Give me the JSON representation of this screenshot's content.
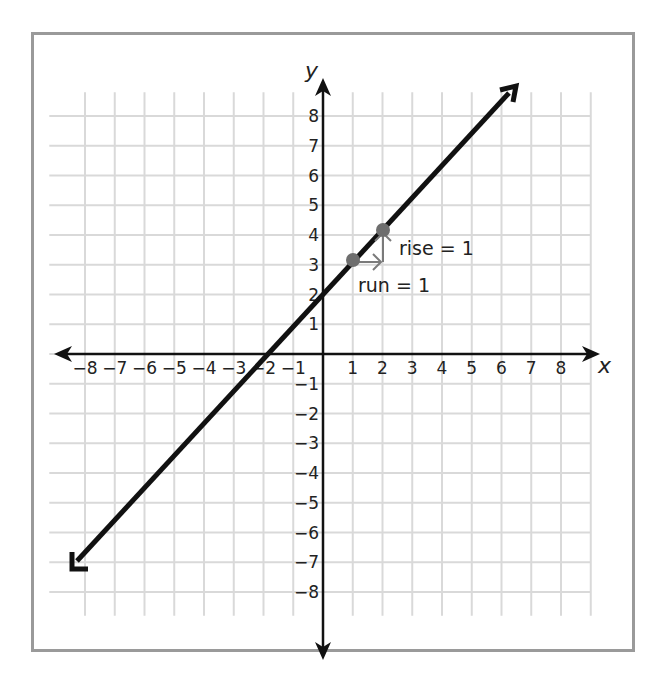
{
  "chart_data": {
    "type": "line",
    "title": "",
    "xlabel": "x",
    "ylabel": "y",
    "xlim": [
      -8,
      8
    ],
    "ylim": [
      -8,
      8
    ],
    "grid": true,
    "x_ticks": [
      "-8",
      "-7",
      "-6",
      "-5",
      "-4",
      "-3",
      "-2",
      "-1",
      "1",
      "2",
      "3",
      "4",
      "5",
      "6",
      "7",
      "8"
    ],
    "y_ticks": [
      "8",
      "7",
      "6",
      "5",
      "4",
      "3",
      "2",
      "1",
      "-1",
      "-2",
      "-3",
      "-4",
      "-5",
      "-6",
      "-7",
      "-8"
    ],
    "series": [
      {
        "name": "y = x + 2",
        "slope": 1,
        "y_intercept": 2,
        "x_intercept": -2,
        "endpoints": [
          {
            "x": -8.3,
            "y": -6.3
          },
          {
            "x": 6.6,
            "y": 8.6
          }
        ],
        "arrows": "both ends"
      }
    ],
    "points": [
      {
        "x": 1,
        "y": 3
      },
      {
        "x": 2,
        "y": 4
      }
    ],
    "annotations": [
      {
        "text": "rise = 1",
        "type": "vertical arrow",
        "from": {
          "x": 2,
          "y": 3
        },
        "to": {
          "x": 2,
          "y": 4
        }
      },
      {
        "text": "run = 1",
        "type": "horizontal arrow",
        "from": {
          "x": 1,
          "y": 3
        },
        "to": {
          "x": 2,
          "y": 3
        }
      }
    ]
  },
  "labels": {
    "x_axis": "x",
    "y_axis": "y",
    "rise": "rise = 1",
    "run": "run = 1"
  },
  "ticks": {
    "x_neg": [
      "−8",
      "−7",
      "−6",
      "−5",
      "−4",
      "−3",
      "−2",
      "−1"
    ],
    "x_pos": [
      "1",
      "2",
      "3",
      "4",
      "5",
      "6",
      "7",
      "8"
    ],
    "y_pos": [
      "1",
      "2",
      "3",
      "4",
      "5",
      "6",
      "7",
      "8"
    ],
    "y_neg": [
      "−1",
      "−2",
      "−3",
      "−4",
      "−5",
      "−6",
      "−7",
      "−8"
    ]
  },
  "colors": {
    "frame": "#9a9a9a",
    "grid": "#d9d9d9",
    "axis": "#111111",
    "line": "#111111",
    "point": "#6e6e6e",
    "annotation_arrow": "#7a7a7a"
  }
}
